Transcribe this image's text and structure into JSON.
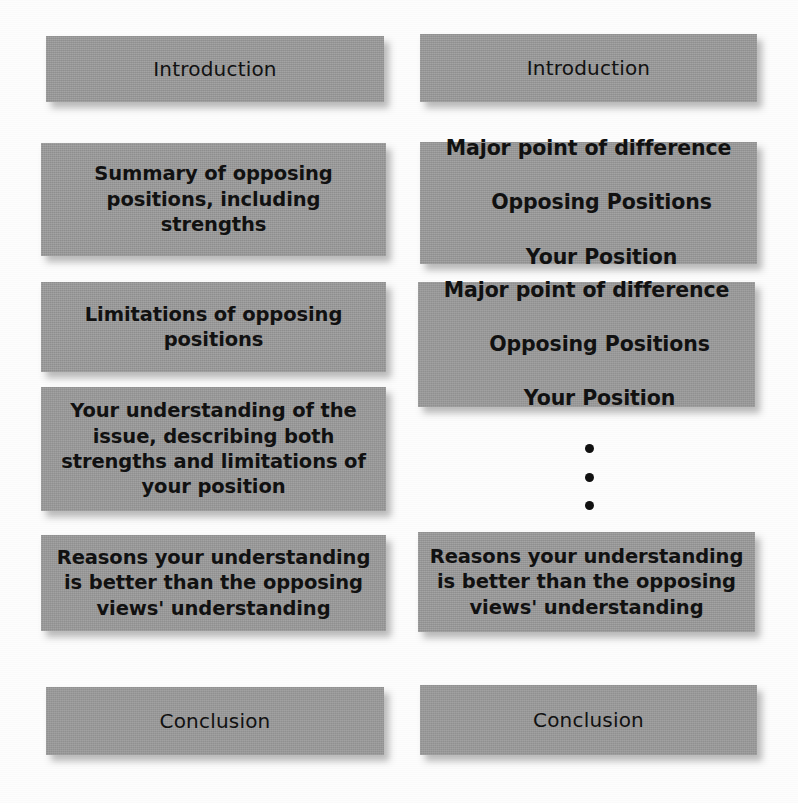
{
  "diagram": {
    "box_fill_color": "#9b9b9b",
    "text_color": "#111111",
    "background_color": "#fdfdfd",
    "columns": [
      {
        "id": "block-method",
        "blocks": [
          {
            "id": "l-intro",
            "label": "Introduction",
            "style": "plain"
          },
          {
            "id": "l-b1",
            "label": "Summary of opposing\npositions, including strengths",
            "style": "bold"
          },
          {
            "id": "l-b2",
            "label": "Limitations of opposing\npositions",
            "style": "bold"
          },
          {
            "id": "l-b3",
            "label": "Your understanding of the\nissue, describing both\nstrengths and limitations of\nyour position",
            "style": "bold"
          },
          {
            "id": "l-b4",
            "label": "Reasons your understanding\nis better than the opposing\nviews' understanding",
            "style": "bold"
          },
          {
            "id": "l-concl",
            "label": "Conclusion",
            "style": "plain"
          }
        ]
      },
      {
        "id": "point-by-point-method",
        "blocks": [
          {
            "id": "r-intro",
            "label": "Introduction",
            "style": "plain"
          },
          {
            "id": "r-b1",
            "style": "stack",
            "line1": "Major point of difference",
            "line2": "Opposing Positions",
            "line3": "Your Position"
          },
          {
            "id": "r-b2",
            "style": "stack",
            "line1": "Major point of difference",
            "line2": "Opposing Positions",
            "line3": "Your Position"
          },
          {
            "id": "r-b3",
            "label": "Reasons your understanding\nis better than the opposing\nviews' understanding",
            "style": "bold"
          },
          {
            "id": "r-concl",
            "label": "Conclusion",
            "style": "plain"
          }
        ],
        "ellipsis": {
          "name": "vertical-ellipsis",
          "dots": 3,
          "meaning": "continues"
        }
      }
    ]
  }
}
